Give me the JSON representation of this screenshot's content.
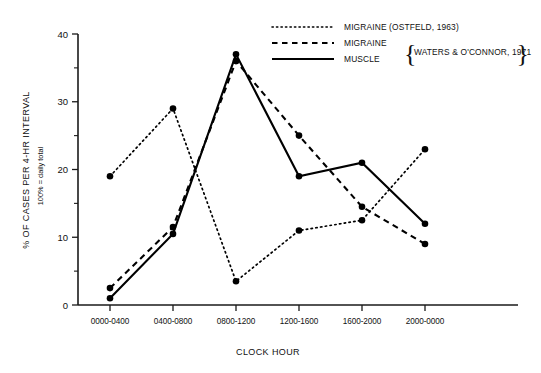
{
  "chart_data": {
    "type": "line",
    "title": "",
    "xlabel": "CLOCK HOUR",
    "ylabel": "% OF CASES PER 4-HR INTERVAL",
    "ylabel_sub": "100% = daily total",
    "categories": [
      "0000-0400",
      "0400-0800",
      "0800-1200",
      "1200-1600",
      "1600-2000",
      "2000-0000"
    ],
    "ylim": [
      0,
      42
    ],
    "yticks": [
      0,
      10,
      20,
      30,
      40
    ],
    "yticks_minor": [
      5,
      15,
      25,
      35
    ],
    "grid": false,
    "legend_position": "top-right",
    "series": [
      {
        "name": "MIGRAINE (OSTFELD, 1963)",
        "style": "dotted",
        "values": [
          19,
          29,
          3.5,
          11,
          12.5,
          23
        ]
      },
      {
        "name": "MIGRAINE",
        "style": "dashed",
        "values": [
          2.5,
          11.5,
          36,
          25,
          14.5,
          9
        ]
      },
      {
        "name": "MUSCLE",
        "style": "solid",
        "values": [
          1,
          10.5,
          37,
          19,
          21,
          12
        ]
      }
    ]
  },
  "legend": {
    "entries": [
      {
        "label": "MIGRAINE (OSTFELD, 1963)",
        "style": "dotted"
      },
      {
        "label": "MIGRAINE",
        "style": "dashed"
      },
      {
        "label": "MUSCLE",
        "style": "solid"
      }
    ],
    "group_label": "WATERS & O'CONNOR, 1971"
  },
  "axes": {
    "x_title": "CLOCK HOUR",
    "y_title": "% OF CASES PER 4-HR INTERVAL",
    "y_subtitle": "100% = daily total",
    "x_ticklabels": [
      "0000-0400",
      "0400-0800",
      "0800-1200",
      "1200-1600",
      "1600-2000",
      "2000-0000"
    ],
    "y_ticklabels": [
      "0",
      "10",
      "20",
      "30",
      "40"
    ]
  },
  "colors": {
    "ink": "#000000",
    "axis": "#1a1a1a",
    "background": "#ffffff"
  }
}
